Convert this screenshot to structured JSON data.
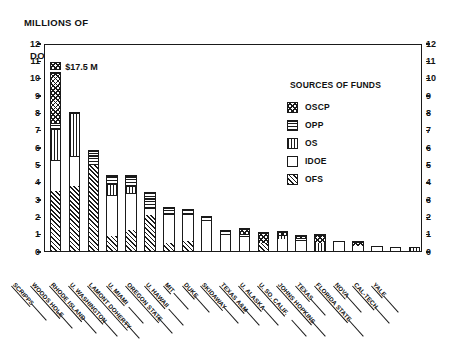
{
  "axis_title": {
    "line1": "MILLIONS OF",
    "line2": "DOLLARS"
  },
  "y_axis": {
    "min": 0,
    "max": 12,
    "ticks": [
      "0",
      "1",
      "2",
      "3",
      "4",
      "5",
      "6",
      "7",
      "8",
      "9",
      "10",
      "11",
      "12"
    ]
  },
  "annotation": {
    "scripps_value": "$17.5 M"
  },
  "legend": {
    "title": "SOURCES OF FUNDS",
    "items": [
      {
        "key": "OSCP",
        "label": "OSCP",
        "pattern": "cross-hatch"
      },
      {
        "key": "OPP",
        "label": "OPP",
        "pattern": "horizontal-lines"
      },
      {
        "key": "OS",
        "label": "OS",
        "pattern": "vertical-lines"
      },
      {
        "key": "IDOE",
        "label": "IDOE",
        "pattern": "solid-white"
      },
      {
        "key": "OFS",
        "label": "OFS",
        "pattern": "diagonal-hatch"
      }
    ]
  },
  "chart_data": {
    "type": "bar",
    "stacked": true,
    "title": "",
    "xlabel": "",
    "ylabel": "MILLIONS OF DOLLARS",
    "ylim": [
      0,
      12
    ],
    "grid": false,
    "legend_position": "upper-right-inside",
    "annotations": [
      {
        "category": "SCRIPPS",
        "text": "$17.5 M",
        "note": "bar truncated with axis break; true total 17.5"
      }
    ],
    "categories": [
      "SCRIPPS",
      "WOODS HOLE",
      "RHODE ISLAND",
      "U. WASHINGTON",
      "LAMONT DOHERTY",
      "U. MIAMI",
      "OREGON STATE",
      "U. HAWAII",
      "MIT",
      "DUKE",
      "SKIDAWAY",
      "TEXAS A&M",
      "U. ALASKA",
      "U. SO. CALIF.",
      "JOHNS HOPKINS",
      "TEXAS",
      "FLORIDA STATE",
      "NOVA",
      "CAL-TECH",
      "YALE"
    ],
    "series": [
      {
        "name": "OFS",
        "values": [
          3.5,
          3.8,
          5.0,
          0.9,
          1.2,
          2.1,
          0.5,
          0.6,
          0.0,
          0.0,
          0.0,
          0.5,
          0.0,
          0.0,
          0.0,
          0.0,
          0.0,
          0.0,
          0.0,
          0.0
        ]
      },
      {
        "name": "IDOE",
        "values": [
          1.8,
          1.7,
          0.0,
          2.4,
          2.2,
          0.4,
          1.7,
          1.6,
          1.8,
          1.0,
          0.85,
          0.0,
          0.75,
          0.65,
          0.0,
          0.55,
          0.35,
          0.3,
          0.25,
          0.0
        ]
      },
      {
        "name": "OS",
        "values": [
          1.8,
          2.5,
          0.0,
          0.6,
          0.4,
          0.0,
          0.0,
          0.0,
          0.0,
          0.0,
          0.0,
          0.0,
          0.2,
          0.0,
          0.5,
          0.0,
          0.0,
          0.0,
          0.0,
          0.25
        ]
      },
      {
        "name": "OPP",
        "values": [
          0.3,
          0.0,
          0.8,
          0.5,
          0.6,
          0.9,
          0.35,
          0.2,
          0.2,
          0.2,
          0.15,
          0.0,
          0.0,
          0.15,
          0.0,
          0.0,
          0.0,
          0.0,
          0.0,
          0.0
        ]
      },
      {
        "name": "OSCP",
        "values": [
          2.9,
          0.0,
          0.0,
          0.0,
          0.0,
          0.0,
          0.0,
          0.0,
          0.0,
          0.0,
          0.3,
          0.6,
          0.2,
          0.1,
          0.5,
          0.0,
          0.2,
          0.0,
          0.0,
          0.0
        ]
      }
    ],
    "totals": [
      17.5,
      8.0,
      5.8,
      4.4,
      4.4,
      3.4,
      2.55,
      2.4,
      2.0,
      1.2,
      1.3,
      1.1,
      1.15,
      0.9,
      1.0,
      0.55,
      0.55,
      0.3,
      0.25,
      0.25
    ]
  }
}
